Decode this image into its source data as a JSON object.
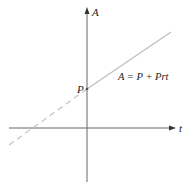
{
  "diagram": {
    "type": "linear-function-graph",
    "axes": {
      "x_label": "t",
      "y_label": "A"
    },
    "intercept_label": "P",
    "equation": "A = P + Prt",
    "line": {
      "solid_segment": "t >= 0",
      "dashed_segment": "t < 0",
      "color": "#b8b8b8"
    },
    "axis_color": "#555555"
  }
}
